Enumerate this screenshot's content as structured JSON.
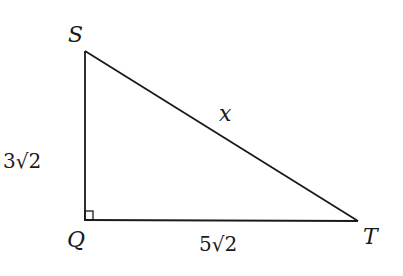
{
  "diagram": {
    "type": "right-triangle",
    "vertices": {
      "S": {
        "label": "S",
        "x": 85,
        "y": 51
      },
      "Q": {
        "label": "Q",
        "x": 85,
        "y": 219
      },
      "T": {
        "label": "T",
        "x": 358,
        "y": 221
      }
    },
    "right_angle_at": "Q",
    "sides": {
      "SQ": {
        "label": "3√2"
      },
      "QT": {
        "label": "5√2"
      },
      "ST": {
        "label": "x"
      }
    },
    "stroke_color": "#1a1a1a"
  }
}
